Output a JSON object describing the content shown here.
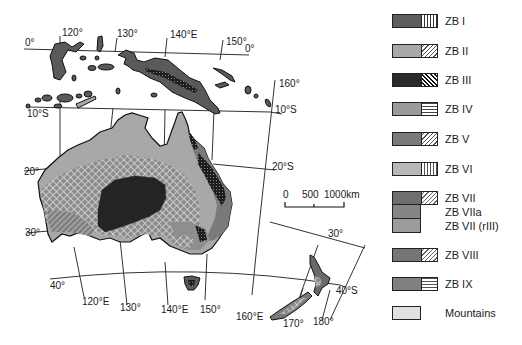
{
  "map": {
    "title": "",
    "graticule": {
      "longitudes_top": [
        "120°",
        "130°",
        "140°E",
        "150°"
      ],
      "longitudes_bottom": [
        "120°E",
        "130°",
        "140°E",
        "150°",
        "160°E",
        "170°",
        "180°"
      ],
      "longitude_right": "160°",
      "latitudes": [
        "0°",
        "0°",
        "10°S",
        "10°S",
        "20°",
        "20°S",
        "30°",
        "30°",
        "40°",
        "40°S"
      ]
    },
    "scale_bar": {
      "labels": [
        "0",
        "500",
        "1000km"
      ]
    },
    "colors": {
      "zb1": "#5e5e5e",
      "zb2": "#a8a8a8",
      "zb3": "#2a2a2a",
      "zb4": "#9a9a9a",
      "zb5": "#7a7a7a",
      "zb6": "#b8b8b8",
      "zb7": "#6e6e6e",
      "zb7a": "#858585",
      "zb7r": "#9c9c9c",
      "zb8": "#767676",
      "zb9": "#808080",
      "mountains": "#c8c8c8"
    }
  },
  "legend": {
    "items": [
      {
        "label": "ZB I",
        "pattern": "vertical-lines"
      },
      {
        "label": "ZB II",
        "pattern": "diagonal-lines"
      },
      {
        "label": "ZB III",
        "pattern": "dense-diagonal"
      },
      {
        "label": "ZB IV",
        "pattern": "horizontal-lines"
      },
      {
        "label": "ZB V",
        "pattern": "diagonal-lines"
      },
      {
        "label": "ZB VI",
        "pattern": "vertical-lines"
      },
      {
        "label": "ZB VII",
        "pattern": "diagonal-lines"
      },
      {
        "label": "ZB VIIa",
        "pattern": "none"
      },
      {
        "label": "ZB VII (rIII)",
        "pattern": "none"
      },
      {
        "label": "ZB VIII",
        "pattern": "diagonal-lines"
      },
      {
        "label": "ZB IX",
        "pattern": "horizontal-lines"
      },
      {
        "label": "Mountains",
        "pattern": "dots"
      }
    ]
  }
}
